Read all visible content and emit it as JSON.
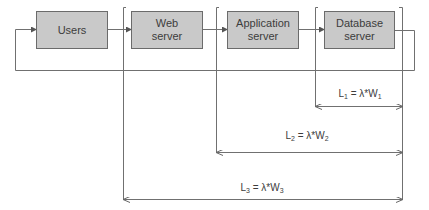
{
  "diagram": {
    "type": "queueing-network",
    "nodes": [
      {
        "id": "users",
        "label": "Users"
      },
      {
        "id": "web",
        "label": "Web\nserver"
      },
      {
        "id": "app",
        "label": "Application\nserver"
      },
      {
        "id": "db",
        "label": "Database\nserver"
      }
    ],
    "edges": [
      {
        "from": "users",
        "to": "web"
      },
      {
        "from": "web",
        "to": "app"
      },
      {
        "from": "app",
        "to": "db"
      },
      {
        "from": "db",
        "to": "users",
        "kind": "feedback-loop"
      }
    ],
    "measures": [
      {
        "id": "L1",
        "sym": "L",
        "sub": "1",
        "eq": " = λ*W",
        "wsub": "1",
        "spans": [
          "db"
        ]
      },
      {
        "id": "L2",
        "sym": "L",
        "sub": "2",
        "eq": " = λ*W",
        "wsub": "2",
        "spans": [
          "app",
          "db"
        ]
      },
      {
        "id": "L3",
        "sym": "L",
        "sub": "3",
        "eq": " = λ*W",
        "wsub": "3",
        "spans": [
          "web",
          "app",
          "db"
        ]
      }
    ]
  },
  "colors": {
    "box_fill": "#c9c9c9",
    "box_border": "#6b6b6b",
    "line": "#707070",
    "text": "#3c3c3c"
  }
}
